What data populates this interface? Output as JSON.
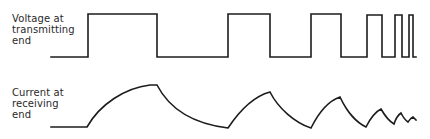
{
  "diagram": {
    "title": "",
    "voltage_trace": {
      "label_lines": [
        "Voltage at",
        "transmitting",
        "end"
      ],
      "description": "Square pulse train at transmitting end with progressively shorter pulses",
      "high_y": 14,
      "low_y": 57,
      "points": "51,57 88,57 88,14 157,14 157,57 228,57 228,14 270,14 270,57 311,57 311,14 341,14 341,57 367,57 367,15 382,15 382,57 395,57 395,15 402,15 402,57 409,57 409,15 413,15 413,57 416,57"
    },
    "current_trace": {
      "label_lines": [
        "Current at",
        "receiving",
        "end"
      ],
      "description": "Exponential rise/decay current response at receiving end, decreasing amplitude with shorter pulses",
      "path": "M51,127 L87,127 C100,104 125,88 150,85 L157,85 C170,110 195,124 228,128 C240,110 255,96 270,92 C278,108 295,123 311,128 C318,114 328,101 340,97 C347,112 357,123 366,127 C370,119 375,112 381,109 C385,116 389,121 394,124 C396,118 398,115 401,113 C403,117 405,120 408,122 C409,120 411,118 413,117 C414,118 415,119 416,120",
      "baseline_y": 127
    },
    "colors": {
      "line": "#1c1c1c",
      "text": "#2a2a2a",
      "background": "#ffffff"
    }
  }
}
